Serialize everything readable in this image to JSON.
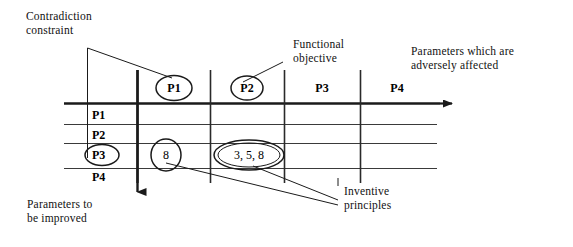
{
  "diagram": {
    "line_color": "#1a1a1a"
  },
  "annotations": {
    "contradiction_constraint": "Contradiction\nconstraint",
    "functional_objective": "Functional\nobjective",
    "adversely_affected": "Parameters which are\nadversely affected",
    "parameters_improved": "Parameters to\nbe improved",
    "inventive_principles": "Inventive\nprinciples"
  },
  "matrix": {
    "column_headers": [
      {
        "label": "P1",
        "circled": true
      },
      {
        "label": "P2",
        "circled": true
      },
      {
        "label": "P3",
        "circled": false
      },
      {
        "label": "P4",
        "circled": false
      }
    ],
    "row_headers": [
      {
        "label": "P1",
        "circled": false
      },
      {
        "label": "P2",
        "circled": false
      },
      {
        "label": "P3",
        "circled": true
      },
      {
        "label": "P4",
        "circled": false
      }
    ],
    "cells": [
      {
        "row": "P3",
        "column": "P1",
        "value": "8",
        "circled": true
      },
      {
        "row": "P3",
        "column": "P2",
        "value": "3, 5, 8",
        "circled": true
      }
    ]
  },
  "axes": {
    "horizontal_arrow": "columns-axis-arrow",
    "vertical_arrow": "rows-axis-arrow"
  }
}
